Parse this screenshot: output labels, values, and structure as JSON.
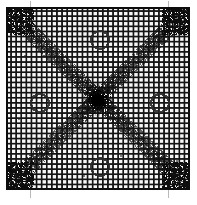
{
  "image": {
    "kind": "scanned-halftone-figure",
    "caption_text": "",
    "width_px": 197,
    "height_px": 205,
    "background_color": "#fdfdfd",
    "ink_color": "#111111",
    "paper_margin_color": "#ffffff"
  },
  "figure": {
    "name": "square-mesh-grid-with-diagonal-bands",
    "description_text": "",
    "frame": {
      "x": 6,
      "y": 7,
      "width": 184,
      "height": 183,
      "border_width_px": 2,
      "border_color": "#0d0d0d"
    },
    "grid": {
      "pitch_px": 5.1,
      "line_width_px": 1.5,
      "line_color": "#141414",
      "columns": 36,
      "rows": 36,
      "cell_fill_color": "#f6f6f6"
    },
    "center_blob": {
      "cx": 98,
      "cy": 100,
      "radius_px": 11,
      "color": "#080808",
      "label_text": ""
    },
    "diagonal_bands": [
      {
        "name": "band-nw-se",
        "x1": 10,
        "y1": 11,
        "x2": 186,
        "y2": 186,
        "width_px": 15,
        "color": "#1a1a1a",
        "label_text": ""
      },
      {
        "name": "band-ne-sw",
        "x1": 186,
        "y1": 11,
        "x2": 10,
        "y2": 186,
        "width_px": 15,
        "color": "#1a1a1a",
        "label_text": ""
      }
    ],
    "circles": [
      {
        "name": "circle-north",
        "cx": 100,
        "cy": 40,
        "r": 9,
        "stroke_color": "#2a2a2a",
        "label_text": ""
      },
      {
        "name": "circle-west",
        "cx": 40,
        "cy": 103,
        "r": 9,
        "stroke_color": "#2a2a2a",
        "label_text": ""
      },
      {
        "name": "circle-east",
        "cx": 160,
        "cy": 103,
        "r": 9,
        "stroke_color": "#2a2a2a",
        "label_text": ""
      },
      {
        "name": "circle-south",
        "cx": 100,
        "cy": 167,
        "r": 9,
        "stroke_color": "#2a2a2a",
        "label_text": ""
      }
    ],
    "tick_marks": [
      {
        "name": "tick-top-left",
        "x": 30,
        "y": 2,
        "orientation": "vertical",
        "length_px": 6
      },
      {
        "name": "tick-top-right",
        "x": 168,
        "y": 2,
        "orientation": "vertical",
        "length_px": 6
      },
      {
        "name": "tick-bottom-left",
        "x": 30,
        "y": 196,
        "orientation": "vertical",
        "length_px": 6
      },
      {
        "name": "tick-bottom-right",
        "x": 168,
        "y": 196,
        "orientation": "vertical",
        "length_px": 6
      }
    ]
  }
}
